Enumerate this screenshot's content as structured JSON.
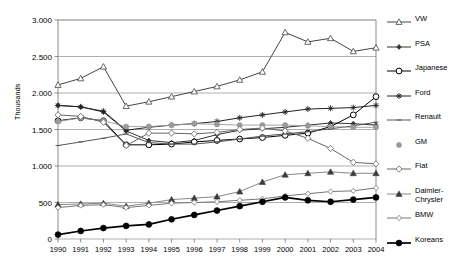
{
  "chart_data": {
    "type": "line",
    "title": "",
    "xlabel": "",
    "ylabel": "Thousands",
    "ylim": [
      0,
      3000
    ],
    "ytick_labels": [
      "0",
      "500",
      "1.000",
      "1.500",
      "2.000",
      "2.500",
      "3.000"
    ],
    "ytick_values": [
      0,
      500,
      1000,
      1500,
      2000,
      2500,
      3000
    ],
    "grid": "horizontal",
    "legend_position": "right",
    "categories": [
      "1990",
      "1991",
      "1992",
      "1993",
      "1994",
      "1995",
      "1996",
      "1997",
      "1998",
      "1999",
      "2000",
      "2001",
      "2002",
      "2003",
      "2004"
    ],
    "series": [
      {
        "name": "VW",
        "marker": "triangle-open",
        "color": "#444444",
        "values": [
          2110,
          2200,
          2360,
          1820,
          1880,
          1950,
          2020,
          2090,
          2180,
          2290,
          2830,
          2700,
          2750,
          2570,
          2620
        ]
      },
      {
        "name": "PSA",
        "marker": "diamond-small-filled",
        "color": "#333333",
        "values": [
          1830,
          1810,
          1740,
          1480,
          1350,
          1320,
          1350,
          1430,
          1490,
          1510,
          1530,
          1560,
          1590,
          1580,
          1560
        ]
      },
      {
        "name": "Japanese",
        "marker": "circle-open",
        "color": "#000000",
        "values": [
          1620,
          1660,
          1620,
          1290,
          1290,
          1300,
          1330,
          1350,
          1370,
          1390,
          1420,
          1450,
          1540,
          1700,
          1950
        ]
      },
      {
        "name": "Ford",
        "marker": "asterisk",
        "color": "#222222",
        "values": [
          1830,
          1810,
          1750,
          1490,
          1530,
          1560,
          1580,
          1610,
          1660,
          1700,
          1740,
          1780,
          1790,
          1800,
          1830
        ]
      },
      {
        "name": "Renault",
        "marker": "dash",
        "color": "#555555",
        "values": [
          1280,
          1330,
          1380,
          1440,
          1320,
          1300,
          1300,
          1330,
          1370,
          1410,
          1440,
          1470,
          1510,
          1550,
          1600
        ]
      },
      {
        "name": "GM",
        "marker": "circle-filled-gray",
        "color": "#9a9a9a",
        "values": [
          1610,
          1660,
          1620,
          1540,
          1540,
          1560,
          1580,
          1570,
          1560,
          1560,
          1560,
          1550,
          1540,
          1530,
          1530
        ]
      },
      {
        "name": "Fiat",
        "marker": "diamond-open",
        "color": "#666666",
        "values": [
          1700,
          1680,
          1600,
          1280,
          1450,
          1450,
          1440,
          1460,
          1500,
          1520,
          1480,
          1380,
          1240,
          1050,
          1030
        ]
      },
      {
        "name": "Daimler-\nChrysler",
        "marker": "triangle-filled",
        "color": "#888888",
        "values": [
          470,
          480,
          490,
          450,
          490,
          540,
          560,
          580,
          650,
          780,
          880,
          900,
          920,
          900,
          900
        ]
      },
      {
        "name": "BMW",
        "marker": "diamond-open-small",
        "color": "#777777",
        "values": [
          430,
          460,
          470,
          430,
          460,
          490,
          500,
          510,
          530,
          550,
          590,
          620,
          650,
          660,
          700
        ]
      },
      {
        "name": "Koreans",
        "marker": "circle-filled",
        "color": "#000000",
        "values": [
          60,
          110,
          150,
          180,
          200,
          270,
          330,
          390,
          450,
          510,
          570,
          530,
          510,
          540,
          570
        ]
      }
    ]
  }
}
